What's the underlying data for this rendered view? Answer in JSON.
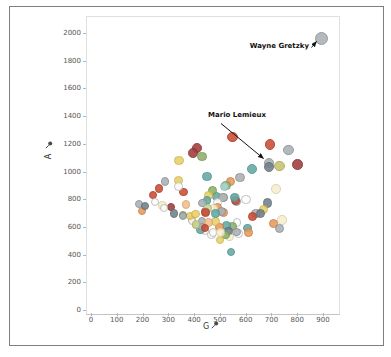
{
  "chart_data": {
    "type": "scatter",
    "title": "",
    "xlabel": "G",
    "ylabel": "A",
    "x_axis_icon": "pin-icon",
    "y_axis_icon": "pin-icon",
    "xlim": [
      0,
      950
    ],
    "ylim": [
      0,
      2050
    ],
    "x_ticks": [
      0,
      100,
      200,
      300,
      400,
      500,
      600,
      700,
      800,
      900
    ],
    "y_ticks": [
      0,
      200,
      400,
      600,
      800,
      1000,
      1200,
      1400,
      1600,
      1800,
      2000
    ],
    "grid": false,
    "legend": "none",
    "annotations": [
      {
        "label": "Wayne Gretzky",
        "g": 894,
        "a": 1963
      },
      {
        "label": "Mario Lemieux",
        "g": 690,
        "a": 1033
      }
    ],
    "palette": {
      "gray": {
        "fill": "#aab0b6",
        "stroke": "#878e95"
      },
      "slate": {
        "fill": "#71808a",
        "stroke": "#5b6a74"
      },
      "red": {
        "fill": "#c94c35",
        "stroke": "#aa3a26"
      },
      "darkred": {
        "fill": "#a03c3c",
        "stroke": "#842e2e"
      },
      "orange": {
        "fill": "#e59a5e",
        "stroke": "#cc7c41"
      },
      "lorange": {
        "fill": "#f2be8d",
        "stroke": "#dba06b"
      },
      "yellow": {
        "fill": "#e9d068",
        "stroke": "#ccb24b"
      },
      "cream": {
        "fill": "#f6efcf",
        "stroke": "#d6cda6"
      },
      "white": {
        "fill": "#fcfcfa",
        "stroke": "#b6bab9"
      },
      "green": {
        "fill": "#8fb069",
        "stroke": "#729551"
      },
      "lgreen": {
        "fill": "#c6d79d",
        "stroke": "#a8bd7b"
      },
      "teal": {
        "fill": "#64a9a4",
        "stroke": "#4c918c"
      },
      "lteal": {
        "fill": "#abd6d0",
        "stroke": "#88bcb5"
      },
      "olive": {
        "fill": "#c3c470",
        "stroke": "#a6a854"
      }
    },
    "points": [
      {
        "name": "Wayne Gretzky",
        "g": 894,
        "a": 1963,
        "color": "gray"
      },
      {
        "name": "Jaromir Jagr",
        "g": 766,
        "a": 1155,
        "color": "gray"
      },
      {
        "name": "Mark Messier",
        "g": 694,
        "a": 1193,
        "color": "red"
      },
      {
        "name": "Gordie Howe",
        "g": 801,
        "a": 1049,
        "color": "darkred"
      },
      {
        "name": "Ron Francis",
        "g": 549,
        "a": 1249,
        "color": "red"
      },
      {
        "name": "Marcel Dionne",
        "g": 731,
        "a": 1040,
        "color": "olive"
      },
      {
        "name": "Steve Yzerman",
        "g": 692,
        "a": 1063,
        "color": "gray"
      },
      {
        "name": "Mario Lemieux",
        "g": 690,
        "a": 1033,
        "color": "slate"
      },
      {
        "name": "Joe Sakic",
        "g": 625,
        "a": 1016,
        "color": "teal"
      },
      {
        "name": "Phil Esposito",
        "g": 717,
        "a": 873,
        "color": "cream"
      },
      {
        "name": "Ray Bourque",
        "g": 410,
        "a": 1169,
        "color": "darkred"
      },
      {
        "name": "Mark Recchi",
        "g": 577,
        "a": 956,
        "color": "gray"
      },
      {
        "name": "Paul Coffey",
        "g": 396,
        "a": 1135,
        "color": "darkred"
      },
      {
        "name": "Stan Mikita",
        "g": 541,
        "a": 926,
        "color": "orange"
      },
      {
        "name": "Teemu Selanne",
        "g": 684,
        "a": 773,
        "color": "slate"
      },
      {
        "name": "Bryan Trottier",
        "g": 524,
        "a": 901,
        "color": "green"
      },
      {
        "name": "Adam Oates",
        "g": 341,
        "a": 1079,
        "color": "yellow"
      },
      {
        "name": "Doug Gilmour",
        "g": 450,
        "a": 964,
        "color": "teal"
      },
      {
        "name": "Dale Hawerchuk",
        "g": 518,
        "a": 891,
        "color": "lteal"
      },
      {
        "name": "Jari Kurri",
        "g": 601,
        "a": 797,
        "color": "white"
      },
      {
        "name": "Luc Robitaille",
        "g": 668,
        "a": 726,
        "color": "yellow"
      },
      {
        "name": "Brett Hull",
        "g": 741,
        "a": 650,
        "color": "cream"
      },
      {
        "name": "Mike Gartner",
        "g": 708,
        "a": 627,
        "color": "orange"
      },
      {
        "name": "Mats Sundin",
        "g": 564,
        "a": 785,
        "color": "gray"
      },
      {
        "name": "Joe Thornton",
        "g": 430,
        "a": 1109,
        "color": "green"
      },
      {
        "name": "Patrick Marleau",
        "g": 566,
        "a": 631,
        "color": "white"
      },
      {
        "name": "Sidney Crosby",
        "g": 486,
        "a": 817,
        "color": "teal"
      },
      {
        "name": "Pierre Turgeon",
        "g": 515,
        "a": 812,
        "color": "lgreen"
      },
      {
        "name": "Dave Andreychuk",
        "g": 640,
        "a": 698,
        "color": "gray"
      },
      {
        "name": "Mike Modano",
        "g": 561,
        "a": 813,
        "color": "white"
      },
      {
        "name": "Jeremy Roenick",
        "g": 513,
        "a": 703,
        "color": "orange"
      },
      {
        "name": "Brendan Shanahan",
        "g": 656,
        "a": 698,
        "color": "slate"
      },
      {
        "name": "Keith Tkachuk",
        "g": 538,
        "a": 527,
        "color": "cream"
      },
      {
        "name": "Denis Savard",
        "g": 473,
        "a": 865,
        "color": "green"
      },
      {
        "name": "Gilbert Perreault",
        "g": 512,
        "a": 814,
        "color": "gray"
      },
      {
        "name": "Alex Delvecchio",
        "g": 456,
        "a": 825,
        "color": "yellow"
      },
      {
        "name": "Jean Ratelle",
        "g": 491,
        "a": 776,
        "color": "white"
      },
      {
        "name": "Peter Stastny",
        "g": 450,
        "a": 789,
        "color": "teal"
      },
      {
        "name": "Norm Ullman",
        "g": 490,
        "a": 739,
        "color": "orange"
      },
      {
        "name": "Jean Beliveau",
        "g": 507,
        "a": 712,
        "color": "gray"
      },
      {
        "name": "Bobby Clarke",
        "g": 358,
        "a": 852,
        "color": "red"
      },
      {
        "name": "Bernie Federko",
        "g": 369,
        "a": 761,
        "color": "lorange"
      },
      {
        "name": "Denis Potvin",
        "g": 310,
        "a": 742,
        "color": "darkred"
      },
      {
        "name": "Larry Murphy",
        "g": 287,
        "a": 929,
        "color": "gray"
      },
      {
        "name": "Al MacInnis",
        "g": 340,
        "a": 934,
        "color": "yellow"
      },
      {
        "name": "Phil Housley",
        "g": 338,
        "a": 894,
        "color": "white"
      },
      {
        "name": "Guy Lafleur",
        "g": 560,
        "a": 793,
        "color": "red"
      },
      {
        "name": "Bernie Nicholls",
        "g": 475,
        "a": 734,
        "color": "cream"
      },
      {
        "name": "Dino Ciccarelli",
        "g": 608,
        "a": 592,
        "color": "teal"
      },
      {
        "name": "Mike Bossy",
        "g": 573,
        "a": 553,
        "color": "white"
      },
      {
        "name": "Michel Goulet",
        "g": 548,
        "a": 604,
        "color": "green"
      },
      {
        "name": "Vincent Damphousse",
        "g": 432,
        "a": 773,
        "color": "gray"
      },
      {
        "name": "Henrik Sedin",
        "g": 240,
        "a": 830,
        "color": "red"
      },
      {
        "name": "Daniel Sedin",
        "g": 393,
        "a": 648,
        "color": "orange"
      },
      {
        "name": "Martin St. Louis",
        "g": 391,
        "a": 642,
        "color": "white"
      },
      {
        "name": "Jarome Iginla",
        "g": 625,
        "a": 675,
        "color": "red"
      },
      {
        "name": "Marian Hossa",
        "g": 525,
        "a": 609,
        "color": "teal"
      },
      {
        "name": "Daniel Alfredsson",
        "g": 444,
        "a": 713,
        "color": "gray"
      },
      {
        "name": "Rod Brind'Amour",
        "g": 452,
        "a": 732,
        "color": "lgreen"
      },
      {
        "name": "Ray Whitney",
        "g": 385,
        "a": 679,
        "color": "yellow"
      },
      {
        "name": "Dale Hunter",
        "g": 323,
        "a": 697,
        "color": "slate"
      },
      {
        "name": "Doug Weight",
        "g": 278,
        "a": 755,
        "color": "cream"
      },
      {
        "name": "Pat LaFontaine",
        "g": 468,
        "a": 545,
        "color": "white"
      },
      {
        "name": "Glenn Anderson",
        "g": 498,
        "a": 601,
        "color": "orange"
      },
      {
        "name": "Dave Taylor",
        "g": 431,
        "a": 638,
        "color": "gray"
      },
      {
        "name": "Johnny Bucyk",
        "g": 556,
        "a": 813,
        "color": "teal"
      },
      {
        "name": "Darryl Sittler",
        "g": 484,
        "a": 637,
        "color": "yellow"
      },
      {
        "name": "Henri Richard",
        "g": 358,
        "a": 688,
        "color": "green"
      },
      {
        "name": "Bobby Hull",
        "g": 610,
        "a": 560,
        "color": "orange"
      },
      {
        "name": "Frank Mahovlich",
        "g": 533,
        "a": 570,
        "color": "slate"
      },
      {
        "name": "Steve Larmer",
        "g": 441,
        "a": 571,
        "color": "white"
      },
      {
        "name": "Theo Fleury",
        "g": 455,
        "a": 633,
        "color": "lorange"
      },
      {
        "name": "Joe Nieuwendyk",
        "g": 564,
        "a": 562,
        "color": "gray"
      },
      {
        "name": "Nicklas Lidstrom",
        "g": 264,
        "a": 878,
        "color": "red"
      },
      {
        "name": "Sergei Fedorov",
        "g": 483,
        "a": 696,
        "color": "teal"
      },
      {
        "name": "Alexander Mogilny",
        "g": 473,
        "a": 559,
        "color": "white"
      },
      {
        "name": "Pat Verbeek",
        "g": 522,
        "a": 541,
        "color": "green"
      },
      {
        "name": "Lanny McDonald",
        "g": 500,
        "a": 506,
        "color": "yellow"
      },
      {
        "name": "Brian Leetch",
        "g": 247,
        "a": 781,
        "color": "white"
      },
      {
        "name": "Bobby Smith",
        "g": 357,
        "a": 679,
        "color": "gray"
      },
      {
        "name": "Joe Mullen",
        "g": 502,
        "a": 561,
        "color": "cream"
      },
      {
        "name": "Brian Propp",
        "g": 425,
        "a": 579,
        "color": "teal"
      },
      {
        "name": "Rod Gilbert",
        "g": 406,
        "a": 615,
        "color": "orange"
      },
      {
        "name": "Alexei Kovalev",
        "g": 430,
        "a": 599,
        "color": "gray"
      },
      {
        "name": "Patrik Elias",
        "g": 408,
        "a": 617,
        "color": "lgreen"
      },
      {
        "name": "Evgeni Malkin",
        "g": 444,
        "a": 702,
        "color": "red"
      },
      {
        "name": "Alex Ovechkin",
        "g": 730,
        "a": 590,
        "color": "gray"
      },
      {
        "name": "Patrick Kane",
        "g": 406,
        "a": 692,
        "color": "yellow"
      },
      {
        "name": "Eric Staal",
        "g": 441,
        "a": 593,
        "color": "red"
      },
      {
        "name": "Ryan Getzlaf",
        "g": 282,
        "a": 737,
        "color": "white"
      },
      {
        "name": "Chris Chelios",
        "g": 185,
        "a": 763,
        "color": "gray"
      },
      {
        "name": "Scott Stevens",
        "g": 196,
        "a": 712,
        "color": "orange"
      },
      {
        "name": "Larry Robinson",
        "g": 208,
        "a": 750,
        "color": "slate"
      },
      {
        "name": "Maurice Richard",
        "g": 544,
        "a": 421,
        "color": "teal"
      }
    ]
  }
}
